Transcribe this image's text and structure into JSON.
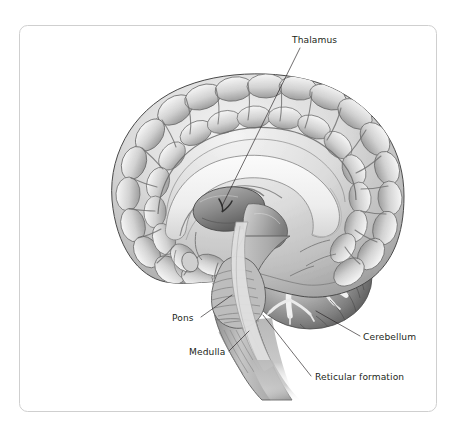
{
  "figure": {
    "style": "grayscale medical illustration",
    "frame": {
      "border_color": "#cccccc",
      "background_color": "#ffffff",
      "corner_radius": 8,
      "x": 19,
      "y": 25,
      "width": 418,
      "height": 387
    },
    "palette": {
      "ink": "#231f20",
      "cortex_light": "#f2f2f2",
      "cortex_mid": "#c9c9c9",
      "cortex_shadow": "#9a9a9a",
      "sulcus_dark": "#6f6f6f",
      "corpus_callosum": "#efefef",
      "brainstem_mid": "#b4b4b4",
      "cerebellum_dark": "#5d5d5d",
      "cerebellum_white_matter": "#f4f4f4",
      "outline": "#3c3c3c"
    },
    "labels": [
      {
        "id": "thalamus",
        "text": "Thalamus",
        "text_x": 292,
        "text_y": 43,
        "anchor": "start",
        "leader": "M 300 48 L 222 206",
        "structure": "thalamus"
      },
      {
        "id": "pons",
        "text": "Pons",
        "text_x": 172,
        "text_y": 321,
        "anchor": "start",
        "leader": "M 201 317 L 232 295",
        "structure": "pons"
      },
      {
        "id": "medulla",
        "text": "Medulla",
        "text_x": 189,
        "text_y": 355,
        "anchor": "start",
        "leader": "M 229 351 L 249 331",
        "structure": "medulla oblongata"
      },
      {
        "id": "cerebellum",
        "text": "Cerebellum",
        "text_x": 363,
        "text_y": 340,
        "anchor": "start",
        "leader": "M 360 336 L 316 311",
        "structure": "cerebellum"
      },
      {
        "id": "reticular-formation",
        "text": "Reticular formation",
        "text_x": 315,
        "text_y": 380,
        "anchor": "start",
        "leader": "M 311 376 L 263 315",
        "structure": "reticular formation"
      }
    ]
  }
}
